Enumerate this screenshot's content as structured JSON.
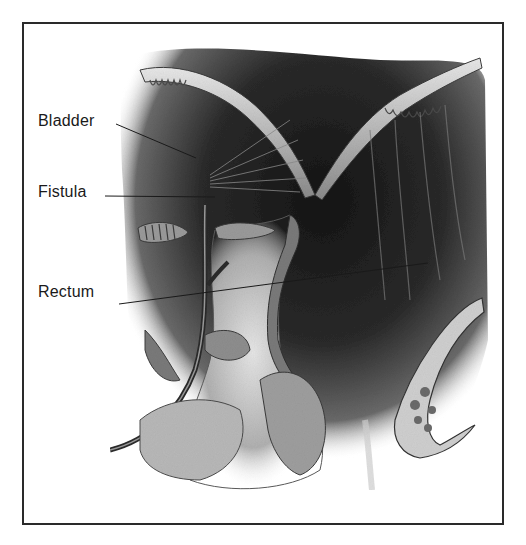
{
  "figure": {
    "type": "anatomical illustration",
    "labels": [
      {
        "id": "bladder",
        "text": "Bladder",
        "x": 38,
        "y": 112,
        "line": [
          116,
          124,
          196,
          158
        ]
      },
      {
        "id": "fistula",
        "text": "Fistula",
        "x": 38,
        "y": 183,
        "line": [
          105,
          196,
          215,
          197
        ]
      },
      {
        "id": "rectum",
        "text": "Rectum",
        "x": 38,
        "y": 283,
        "line": [
          119,
          304,
          428,
          263
        ]
      }
    ],
    "colors": {
      "border": "#2a2a2a",
      "ink": "#1a1a1a",
      "dark_tissue": "#1e1e1e",
      "mid_tissue": "#6e6e6e",
      "light_tissue": "#d8d8d8"
    }
  }
}
